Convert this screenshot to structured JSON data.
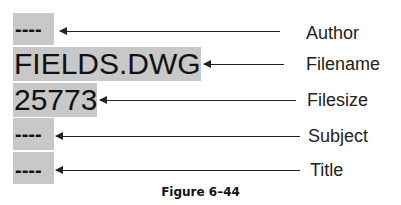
{
  "figure": {
    "caption": "Figure 6–44",
    "fields": [
      {
        "label": "Author",
        "value": "----"
      },
      {
        "label": "Filename",
        "value": "FIELDS.DWG"
      },
      {
        "label": "Filesize",
        "value": "25773"
      },
      {
        "label": "Subject",
        "value": "----"
      },
      {
        "label": "Title",
        "value": "----"
      }
    ]
  },
  "colors": {
    "field_highlight": "#c8c8c8",
    "text": "#111111",
    "arrow": "#222222",
    "background": "#ffffff"
  }
}
